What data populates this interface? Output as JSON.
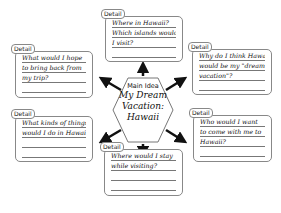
{
  "main_idea": {
    "label": "Main Idea",
    "lines": [
      "My Dream",
      "Vacation:",
      "Hawaii"
    ]
  },
  "details": [
    {
      "position": "top",
      "tab": "Detail",
      "lines": [
        "Where in Hawaii?",
        "Which islands would",
        "I visit?",
        ""
      ]
    },
    {
      "position": "top-left",
      "tab": "Detail",
      "lines": [
        "What would I hope",
        "to bring back from",
        "my trip?",
        ""
      ]
    },
    {
      "position": "top-right",
      "tab": "Detail",
      "lines": [
        "Why do I think Hawaii",
        "would be my \"dream",
        "vacation\"?",
        ""
      ]
    },
    {
      "position": "bottom-left",
      "tab": "Detail",
      "lines": [
        "What kinds of things",
        "would I do in Hawaii?",
        "",
        ""
      ]
    },
    {
      "position": "bottom-right",
      "tab": "Detail",
      "lines": [
        "Who would I want",
        "to come with me to",
        "Hawaii?",
        ""
      ]
    },
    {
      "position": "bottom",
      "tab": "Detail",
      "lines": [
        "Where would I stay",
        "while visiting?",
        "",
        ""
      ]
    }
  ]
}
